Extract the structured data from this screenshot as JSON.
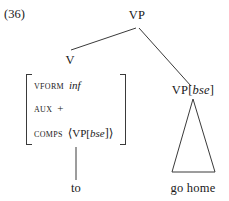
{
  "figure": {
    "example_number": "(36)",
    "type": "syntax-tree"
  },
  "tree": {
    "root": {
      "label": "VP"
    },
    "left_branch": {
      "label": "V",
      "feature_structure": {
        "rows": [
          {
            "attribute": "VFORM",
            "value": "inf",
            "value_style": "italic"
          },
          {
            "attribute": "AUX",
            "value": "+",
            "value_style": "roman"
          },
          {
            "attribute": "COMPS",
            "value_open": "⟨",
            "value_category": "VP[",
            "value_tag": "bse",
            "value_close": "]⟩"
          }
        ]
      },
      "terminal": "to"
    },
    "right_branch": {
      "label_category": "VP[",
      "label_tag": "bse",
      "label_close": "]",
      "terminal": "go home",
      "has_triangle": true
    }
  },
  "colors": {
    "line": "#3a3a3a",
    "text": "#1a1a1a",
    "background": "#ffffff"
  }
}
